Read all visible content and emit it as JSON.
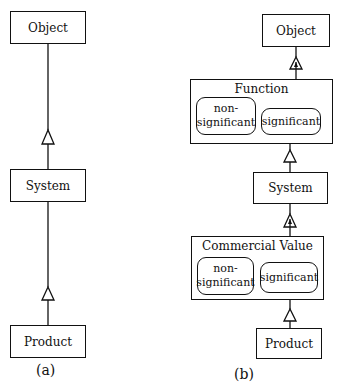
{
  "diagram_a": {
    "caption": "(a)",
    "nodes": {
      "object": "Object",
      "system": "System",
      "product": "Product"
    },
    "edges": [
      {
        "from": "system",
        "to": "object",
        "type": "generalization"
      },
      {
        "from": "product",
        "to": "system",
        "type": "generalization"
      }
    ]
  },
  "diagram_b": {
    "caption": "(b)",
    "nodes": {
      "object": "Object",
      "function": {
        "title": "Function",
        "non_significant": "non-\nsignificant",
        "significant": "significant"
      },
      "system": "System",
      "commercial_value": {
        "title": "Commercial Value",
        "non_significant": "non-\nsignificant",
        "significant": "significant"
      },
      "product": "Product"
    },
    "edges": [
      {
        "from": "function",
        "to": "object",
        "type": "generalization-filled"
      },
      {
        "from": "system",
        "to": "function.significant",
        "type": "generalization"
      },
      {
        "from": "commercial_value",
        "to": "system",
        "type": "generalization-filled"
      },
      {
        "from": "product",
        "to": "commercial_value.significant",
        "type": "generalization"
      }
    ]
  }
}
